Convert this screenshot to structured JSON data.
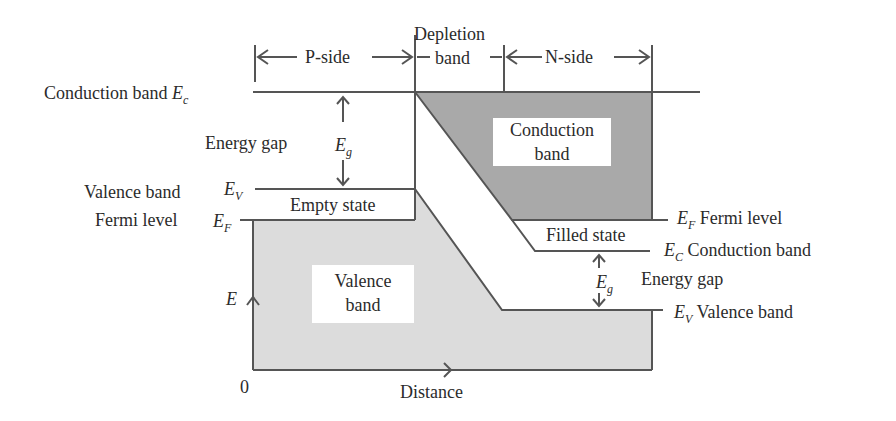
{
  "figure": {
    "type": "energy band diagram"
  },
  "regions": {
    "p_side": "P-side",
    "depletion_line1": "Depletion",
    "depletion_line2": "band",
    "n_side": "N-side"
  },
  "left_labels": {
    "conduction_band": "Conduction band",
    "conduction_symbol": "E",
    "conduction_sub": "c",
    "energy_gap": "Energy gap",
    "eg_symbol": "E",
    "eg_sub": "g",
    "valence_band": "Valence band",
    "valence_symbol": "E",
    "valence_sub": "V",
    "fermi_level": "Fermi level",
    "fermi_symbol": "E",
    "fermi_sub": "F"
  },
  "right_labels": {
    "fermi_symbol": "E",
    "fermi_sub": "F",
    "fermi_level": "Fermi level",
    "conduction_symbol": "E",
    "conduction_sub": "C",
    "conduction_band": "Conduction band",
    "energy_gap": "Energy gap",
    "eg_symbol": "E",
    "eg_sub": "g",
    "valence_symbol": "E",
    "valence_sub": "V",
    "valence_band": "Valence band"
  },
  "areas": {
    "empty_state": "Empty state",
    "filled_state": "Filled state",
    "conduction_band_line1": "Conduction",
    "conduction_band_line2": "band",
    "valence_band_line1": "Valence",
    "valence_band_line2": "band"
  },
  "axes": {
    "y_label": "E",
    "origin": "0",
    "x_label": "Distance"
  },
  "colors": {
    "line": "#555555",
    "conduction_fill": "#a9a9a9",
    "valence_fill": "#dcdcdc",
    "background": "#ffffff"
  }
}
